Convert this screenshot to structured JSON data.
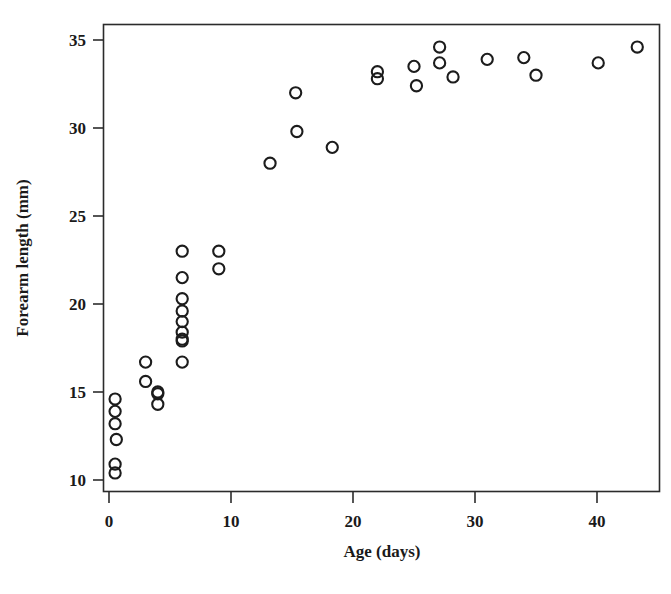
{
  "chart_data": {
    "type": "scatter",
    "title": "",
    "xlabel": "Age (days)",
    "ylabel": "Forearm length (mm)",
    "xlim": [
      -1.8,
      45.6
    ],
    "ylim": [
      9.4,
      35.9
    ],
    "xticks": [
      0,
      10,
      20,
      30,
      40
    ],
    "xtick_labels": [
      "0",
      "10",
      "20",
      "30",
      "40"
    ],
    "yticks": [
      10,
      15,
      20,
      25,
      30,
      35
    ],
    "ytick_labels": [
      "10",
      "15",
      "20",
      "25",
      "30",
      "35"
    ],
    "grid": false,
    "legend": null,
    "marker": "open-circle",
    "marker_color": "#1c1c1c",
    "points": [
      {
        "x": 0.5,
        "y": 14.6
      },
      {
        "x": 0.5,
        "y": 13.9
      },
      {
        "x": 0.5,
        "y": 13.2
      },
      {
        "x": 0.6,
        "y": 12.3
      },
      {
        "x": 0.5,
        "y": 10.9
      },
      {
        "x": 0.5,
        "y": 10.4
      },
      {
        "x": 3.0,
        "y": 16.7
      },
      {
        "x": 3.0,
        "y": 15.6
      },
      {
        "x": 4.0,
        "y": 15.0
      },
      {
        "x": 4.0,
        "y": 14.9
      },
      {
        "x": 4.0,
        "y": 14.3
      },
      {
        "x": 6.0,
        "y": 23.0
      },
      {
        "x": 6.0,
        "y": 21.5
      },
      {
        "x": 6.0,
        "y": 20.3
      },
      {
        "x": 6.0,
        "y": 19.6
      },
      {
        "x": 6.0,
        "y": 19.0
      },
      {
        "x": 6.0,
        "y": 18.4
      },
      {
        "x": 6.0,
        "y": 18.0
      },
      {
        "x": 6.0,
        "y": 17.9
      },
      {
        "x": 6.0,
        "y": 16.7
      },
      {
        "x": 9.0,
        "y": 23.0
      },
      {
        "x": 9.0,
        "y": 22.0
      },
      {
        "x": 13.2,
        "y": 28.0
      },
      {
        "x": 15.3,
        "y": 32.0
      },
      {
        "x": 15.4,
        "y": 29.8
      },
      {
        "x": 18.3,
        "y": 28.9
      },
      {
        "x": 22.0,
        "y": 33.2
      },
      {
        "x": 22.0,
        "y": 32.8
      },
      {
        "x": 25.0,
        "y": 33.5
      },
      {
        "x": 25.2,
        "y": 32.4
      },
      {
        "x": 27.1,
        "y": 34.6
      },
      {
        "x": 27.1,
        "y": 33.7
      },
      {
        "x": 28.2,
        "y": 32.9
      },
      {
        "x": 31.0,
        "y": 33.9
      },
      {
        "x": 34.0,
        "y": 34.0
      },
      {
        "x": 35.0,
        "y": 33.0
      },
      {
        "x": 40.1,
        "y": 33.7
      },
      {
        "x": 43.3,
        "y": 34.6
      }
    ]
  },
  "axes": {
    "x_axis_title": "Age (days)",
    "y_axis_title": "Forearm length (mm)",
    "x_tick_labels": [
      "0",
      "10",
      "20",
      "30",
      "40"
    ],
    "y_tick_labels": [
      "10",
      "15",
      "20",
      "25",
      "30",
      "35"
    ]
  }
}
